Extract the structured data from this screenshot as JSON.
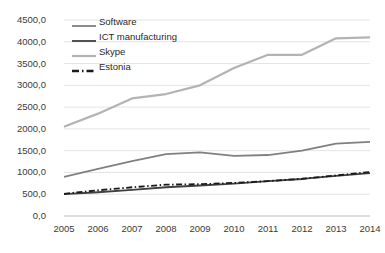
{
  "chart_data": {
    "type": "line",
    "title": "",
    "xlabel": "",
    "ylabel": "",
    "grid": true,
    "legend_position": "top-left",
    "x": [
      2005,
      2006,
      2007,
      2008,
      2009,
      2010,
      2011,
      2012,
      2013,
      2014
    ],
    "xtick_labels": [
      "2005",
      "2006",
      "2007",
      "2008",
      "2009",
      "2010",
      "2011",
      "2012",
      "2013",
      "2014"
    ],
    "ylim": [
      0,
      4500
    ],
    "ytick_labels": [
      "0,0",
      "500,0",
      "1000,0",
      "1500,0",
      "2000,0",
      "2500,0",
      "3000,0",
      "3500,0",
      "4000,0",
      "4500,0"
    ],
    "ytick_values": [
      0,
      500,
      1000,
      1500,
      2000,
      2500,
      3000,
      3500,
      4000,
      4500
    ],
    "series": [
      {
        "name": "Software",
        "color": "#808080",
        "style": "solid",
        "width": 1.8,
        "values": [
          900,
          1080,
          1260,
          1420,
          1460,
          1380,
          1400,
          1500,
          1660,
          1700
        ]
      },
      {
        "name": "ICT manufacturing",
        "color": "#404040",
        "style": "solid",
        "width": 1.8,
        "values": [
          500,
          545,
          600,
          660,
          700,
          745,
          800,
          850,
          920,
          985
        ]
      },
      {
        "name": "Skype",
        "color": "#b3b3b3",
        "style": "solid",
        "width": 2.2,
        "values": [
          2050,
          2350,
          2700,
          2800,
          3000,
          3400,
          3700,
          3700,
          4080,
          4100
        ]
      },
      {
        "name": "Estonia",
        "color": "#1a1a1a",
        "style": "dashdot",
        "width": 1.8,
        "values": [
          510,
          590,
          660,
          720,
          730,
          760,
          800,
          855,
          930,
          1010
        ]
      }
    ]
  },
  "legend": {
    "items": [
      {
        "label": "Software",
        "swatch": "legend-line-software"
      },
      {
        "label": "ICT manufacturing",
        "swatch": "legend-line-ict-manufacturing"
      },
      {
        "label": "Skype",
        "swatch": "legend-line-skype"
      },
      {
        "label": "Estonia",
        "swatch": "legend-line-estonia"
      }
    ]
  }
}
